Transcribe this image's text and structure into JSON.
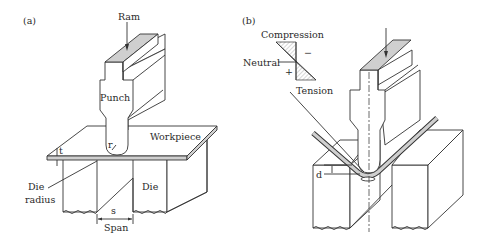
{
  "figure": {
    "panels": [
      {
        "id": "a",
        "label": "(a)",
        "labels": {
          "ram": "Ram",
          "punch": "Punch",
          "workpiece": "Workpiece",
          "thickness": "t",
          "punch_radius": "r",
          "die_radius_line1": "Die",
          "die_radius_line2": "radius",
          "die": "Die",
          "span_symbol": "s",
          "span": "Span"
        }
      },
      {
        "id": "b",
        "label": "(b)",
        "labels": {
          "compression": "Compression",
          "neutral": "Neutral",
          "tension": "Tension",
          "minus": "−",
          "plus": "+",
          "depth": "d"
        }
      }
    ],
    "colors": {
      "line": "#333333",
      "shaded_top": "#cfcfcf",
      "background": "#ffffff"
    }
  }
}
